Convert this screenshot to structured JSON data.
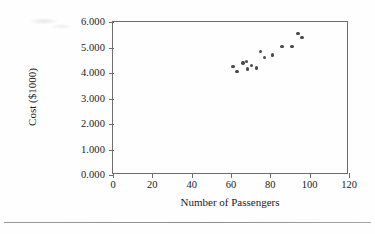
{
  "figure": {
    "background_color": "#fefefe",
    "axis_color": "#6e6e6e",
    "marker_color": "#4a4a4a"
  },
  "chart_data": {
    "type": "scatter",
    "title": "",
    "xlabel": "Number of Passengers",
    "ylabel": "Cost ($1000)",
    "xlim": [
      0,
      120
    ],
    "ylim": [
      0,
      6
    ],
    "xticks": [
      0,
      20,
      40,
      60,
      80,
      100,
      120
    ],
    "xtick_labels": [
      "0",
      "20",
      "40",
      "60",
      "80",
      "100",
      "120"
    ],
    "yticks": [
      0,
      1,
      2,
      3,
      4,
      5,
      6
    ],
    "ytick_labels": [
      "0.000",
      "1.000",
      "2.000",
      "3.000",
      "4.000",
      "5.000",
      "6.000"
    ],
    "grid": false,
    "legend": null,
    "series": [
      {
        "name": "Flight cost vs passengers",
        "marker": "filled-circle",
        "points": [
          {
            "x": 61.0,
            "y": 4.25
          },
          {
            "x": 63.0,
            "y": 4.05
          },
          {
            "x": 66.0,
            "y": 4.4
          },
          {
            "x": 68.0,
            "y": 4.45
          },
          {
            "x": 68.5,
            "y": 4.15
          },
          {
            "x": 70.5,
            "y": 4.3
          },
          {
            "x": 73.0,
            "y": 4.2
          },
          {
            "x": 75.0,
            "y": 4.85
          },
          {
            "x": 77.0,
            "y": 4.6
          },
          {
            "x": 81.0,
            "y": 4.7
          },
          {
            "x": 86.0,
            "y": 5.05
          },
          {
            "x": 91.0,
            "y": 5.05
          },
          {
            "x": 94.0,
            "y": 5.55
          },
          {
            "x": 96.0,
            "y": 5.4
          }
        ]
      }
    ]
  }
}
